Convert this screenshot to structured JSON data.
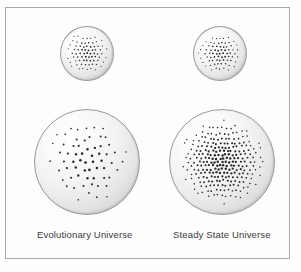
{
  "figure": {
    "background_color": "#fefefe",
    "frame_color": "#a9a9ad",
    "sphere_fill_light": "#ffffff",
    "sphere_fill_shadow": "#b0b0b0",
    "dot_color": "#2b2b2b"
  },
  "labels": {
    "left": "Evolutionary Universe",
    "right": "Steady State Universe"
  },
  "chart_data": {
    "type": "diagram",
    "title": "",
    "columns": [
      {
        "name": "Evolutionary Universe",
        "label": "Evolutionary Universe",
        "spheres": [
          {
            "stage": "early",
            "size": "small",
            "diameter_px": 54,
            "dot_count": 84,
            "dot_density": "high"
          },
          {
            "stage": "later",
            "size": "large",
            "diameter_px": 106,
            "dot_count": 84,
            "dot_density": "low"
          }
        ]
      },
      {
        "name": "Steady State Universe",
        "label": "Steady State Universe",
        "spheres": [
          {
            "stage": "early",
            "size": "small",
            "diameter_px": 54,
            "dot_count": 84,
            "dot_density": "high"
          },
          {
            "stage": "later",
            "size": "large",
            "diameter_px": 106,
            "dot_count": 330,
            "dot_density": "high"
          }
        ]
      }
    ],
    "legend": [],
    "annotations": []
  },
  "spheres": {
    "evo_small": {
      "name": "evolutionary-universe-early",
      "dot_count": 84,
      "grid_step": 5.3,
      "jitter": 0.55,
      "dot_radius": 0.95
    },
    "steady_small": {
      "name": "steady-state-universe-early",
      "dot_count": 84,
      "grid_step": 5.3,
      "jitter": 0.55,
      "dot_radius": 0.95
    },
    "evo_large": {
      "name": "evolutionary-universe-later",
      "dot_count": 84,
      "grid_step": 11.2,
      "jitter": 0.9,
      "dot_radius": 1.35
    },
    "steady_large": {
      "name": "steady-state-universe-later",
      "dot_count": 330,
      "grid_step": 5.6,
      "jitter": 0.7,
      "dot_radius": 1.25
    }
  }
}
